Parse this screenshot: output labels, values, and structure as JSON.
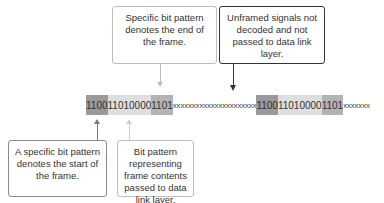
{
  "callouts": {
    "end_flag": "Specific bit pattern denotes the end of the frame.",
    "unframed": "Unframed signals not decoded and not passed to data link layer.",
    "start_flag": "A specific bit pattern denotes the start of the frame.",
    "contents": "Bit pattern representing frame contents passed to data link layer."
  },
  "bitstream": {
    "frame1_start": "1100",
    "frame1_contents": "11010000",
    "frame1_end": "1101",
    "gap": "xxxxxxxxxxxxxxxxxxxxxx",
    "frame2_start": "1100",
    "frame2_contents": "11010000",
    "frame2_end": "1101",
    "tail": "xxxxxxx"
  }
}
